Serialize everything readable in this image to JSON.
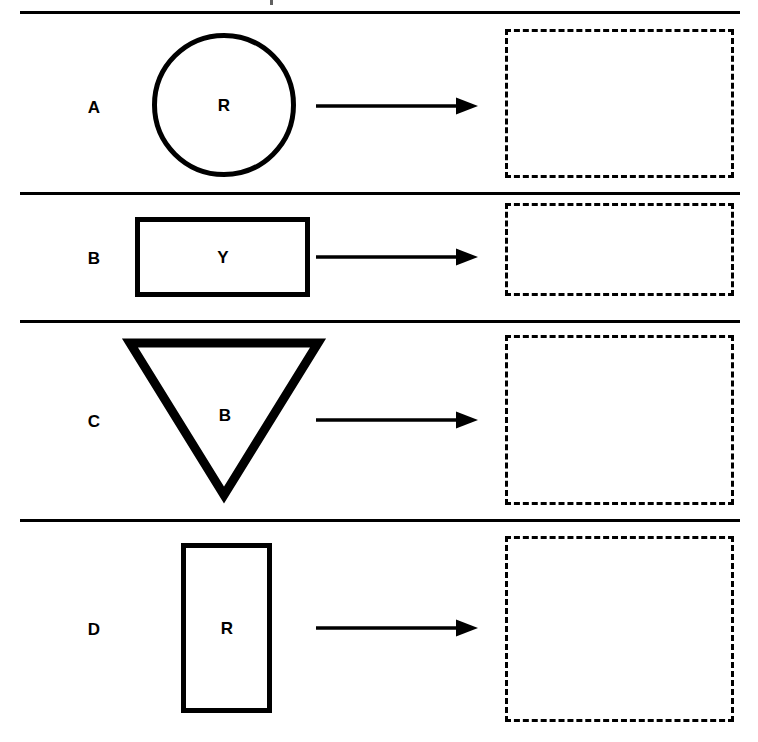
{
  "worksheet": {
    "width": 758,
    "height": 742,
    "background_color": "#ffffff",
    "ink_color": "#000000",
    "divider_color": "#000000",
    "answer_box_border_style": "dashed",
    "arrow_label": "maps-to-arrow"
  },
  "rows": [
    {
      "id": "row-a",
      "label": "A",
      "shape": {
        "kind": "circle",
        "letter": "R",
        "icon_name": "circle-outline-shape"
      },
      "answer_box": {
        "value": ""
      }
    },
    {
      "id": "row-b",
      "label": "B",
      "shape": {
        "kind": "rectangle-wide",
        "letter": "Y",
        "icon_name": "rectangle-outline-shape"
      },
      "answer_box": {
        "value": ""
      }
    },
    {
      "id": "row-c",
      "label": "C",
      "shape": {
        "kind": "triangle-down",
        "letter": "B",
        "icon_name": "inverted-triangle-outline-shape"
      },
      "answer_box": {
        "value": ""
      }
    },
    {
      "id": "row-d",
      "label": "D",
      "shape": {
        "kind": "rectangle-tall",
        "letter": "R",
        "icon_name": "rectangle-outline-shape"
      },
      "answer_box": {
        "value": ""
      }
    }
  ]
}
